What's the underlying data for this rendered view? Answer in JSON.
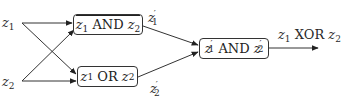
{
  "diagram": {
    "inputs": [
      {
        "id": "z1",
        "var": "z",
        "sub": "1"
      },
      {
        "id": "z2",
        "var": "z",
        "sub": "2"
      }
    ],
    "nodes": [
      {
        "id": "nand",
        "left_var": "z",
        "left_sub": "1",
        "op": "AND",
        "right_var": "z",
        "right_sub": "2",
        "negated": true
      },
      {
        "id": "or",
        "left_var": "z",
        "left_sub": "1",
        "op": "OR",
        "right_var": "z",
        "right_sub": "2",
        "negated": false
      },
      {
        "id": "and_final",
        "left_var": "z",
        "left_sub": "1",
        "left_prime": "′",
        "op": "AND",
        "right_var": "z",
        "right_sub": "2",
        "right_prime": "′",
        "negated": false
      }
    ],
    "intermediate": [
      {
        "id": "z1p",
        "var": "z",
        "sub": "1",
        "prime": "′"
      },
      {
        "id": "z2p",
        "var": "z",
        "sub": "2",
        "prime": "′"
      }
    ],
    "output": {
      "left_var": "z",
      "left_sub": "1",
      "op": "XOR",
      "right_var": "z",
      "right_sub": "2"
    },
    "edges": [
      [
        "z1",
        "nand"
      ],
      [
        "z1",
        "or"
      ],
      [
        "z2",
        "nand"
      ],
      [
        "z2",
        "or"
      ],
      [
        "nand",
        "and_final"
      ],
      [
        "or",
        "and_final"
      ],
      [
        "and_final",
        "output"
      ]
    ],
    "colors": {
      "stroke": "#333333",
      "text": "#2a2a2a",
      "background": "#ffffff"
    }
  }
}
